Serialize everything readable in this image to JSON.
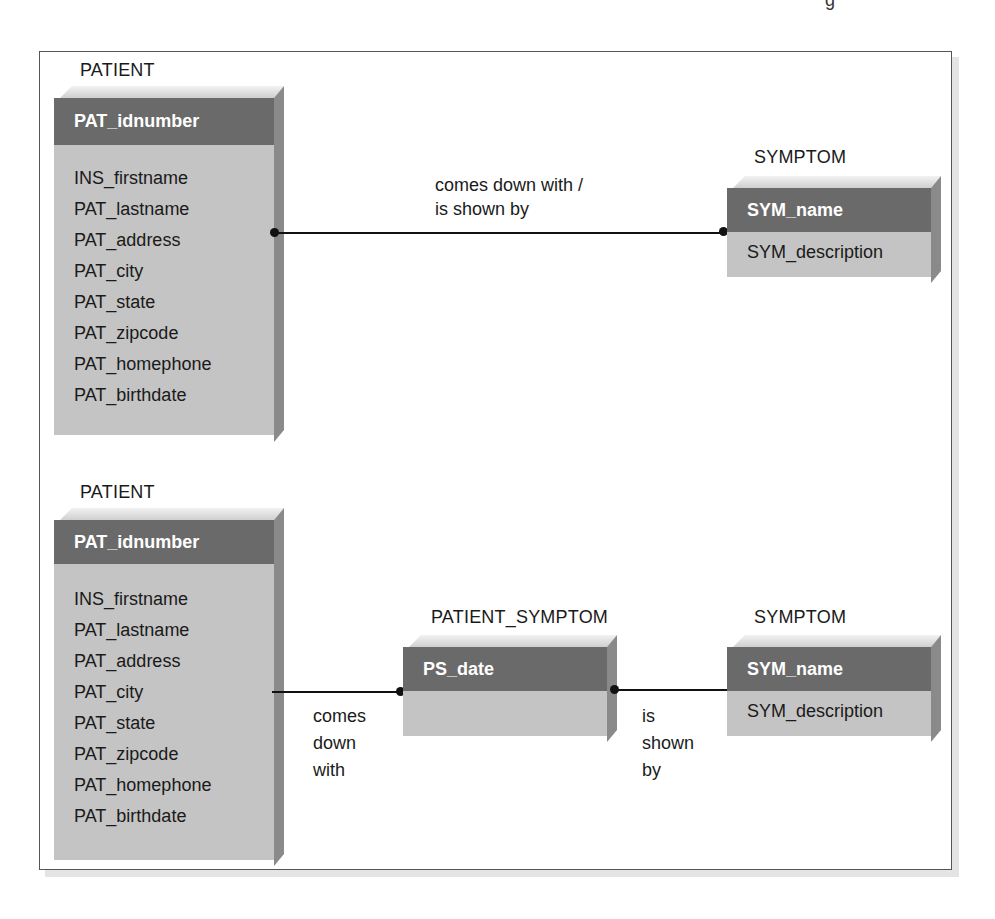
{
  "page_fragment_glyph": "g",
  "diagram_top": {
    "patient": {
      "title": "PATIENT",
      "primary_key": "PAT_idnumber",
      "attributes": [
        "INS_firstname",
        "PAT_lastname",
        "PAT_address",
        "PAT_city",
        "PAT_state",
        "PAT_zipcode",
        "PAT_homephone",
        "PAT_birthdate"
      ]
    },
    "relationship": {
      "label_line1": "comes down with /",
      "label_line2": "is shown by"
    },
    "symptom": {
      "title": "SYMPTOM",
      "primary_key": "SYM_name",
      "attributes": [
        "SYM_description"
      ]
    }
  },
  "diagram_bottom": {
    "patient": {
      "title": "PATIENT",
      "primary_key": "PAT_idnumber",
      "attributes": [
        "INS_firstname",
        "PAT_lastname",
        "PAT_address",
        "PAT_city",
        "PAT_state",
        "PAT_zipcode",
        "PAT_homephone",
        "PAT_birthdate"
      ]
    },
    "relationship_left": {
      "lines": [
        "comes",
        "down",
        "with"
      ]
    },
    "patient_symptom": {
      "title": "PATIENT_SYMPTOM",
      "primary_key": "PS_date",
      "attributes": []
    },
    "relationship_right": {
      "lines": [
        "is",
        "shown",
        "by"
      ]
    },
    "symptom": {
      "title": "SYMPTOM",
      "primary_key": "SYM_name",
      "attributes": [
        "SYM_description"
      ]
    }
  },
  "colors": {
    "header_fill": "#6a6a6a",
    "body_fill": "#c4c4c4",
    "side_fill": "#8a8a8a",
    "line": "#111111",
    "frame": "#555555"
  }
}
